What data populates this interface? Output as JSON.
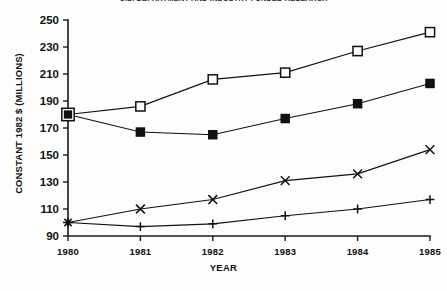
{
  "title": "U.S. DEPARTMENT AND INDUSTRY FUNDED RESEARCH",
  "axes": {
    "y_label": "CONSTANT 1982 $ (MILLIONS)",
    "x_label": "YEAR",
    "y_ticks": [
      "250",
      "230",
      "210",
      "190",
      "170",
      "150",
      "130",
      "110",
      "90"
    ],
    "x_ticks": [
      "1980",
      "1981",
      "1982",
      "1983",
      "1984",
      "1985"
    ]
  },
  "chart_data": {
    "type": "line",
    "title": "U.S. DEPARTMENT AND INDUSTRY FUNDED RESEARCH",
    "xlabel": "YEAR",
    "ylabel": "CONSTANT 1982 $ (MILLIONS)",
    "categories": [
      "1980",
      "1981",
      "1982",
      "1983",
      "1984",
      "1985"
    ],
    "x": [
      1980,
      1981,
      1982,
      1983,
      1984,
      1985
    ],
    "ylim": [
      90,
      250
    ],
    "xlim": [
      1980,
      1985
    ],
    "ytick_step": 20,
    "grid": false,
    "legend": "none",
    "series": [
      {
        "name": "open-square",
        "marker": "open-square",
        "values": [
          180,
          186,
          206,
          211,
          227,
          241
        ]
      },
      {
        "name": "filled-square",
        "marker": "filled-square",
        "values": [
          180,
          167,
          165,
          177,
          188,
          203
        ]
      },
      {
        "name": "cross",
        "marker": "cross",
        "values": [
          100,
          110,
          117,
          131,
          136,
          154
        ]
      },
      {
        "name": "plus",
        "marker": "plus",
        "values": [
          100,
          97,
          99,
          105,
          110,
          117
        ]
      }
    ]
  },
  "colors": {
    "ink": "#111111",
    "background": "#fdfdfd"
  }
}
